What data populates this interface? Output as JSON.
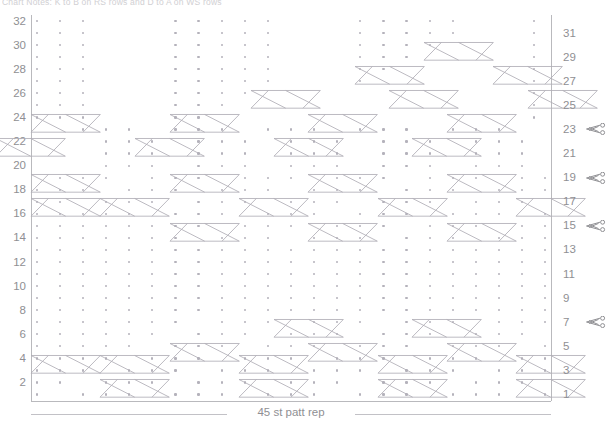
{
  "title": "Chart Notes: K to B on RS rows and D to A on WS rows",
  "chart_data": {
    "type": "table",
    "columns": 45,
    "rows": 32,
    "repeat_label": "45 st patt rep",
    "left_axis_label": "",
    "right_axis_label": "",
    "left_row_numbers": [
      32,
      30,
      28,
      26,
      24,
      22,
      20,
      18,
      16,
      14,
      12,
      10,
      8,
      6,
      4,
      2
    ],
    "right_row_numbers": [
      31,
      29,
      27,
      25,
      23,
      21,
      19,
      17,
      15,
      13,
      11,
      9,
      7,
      5,
      3,
      1
    ],
    "scissor_marker_rows": [
      23,
      19,
      15,
      7
    ],
    "legend": [
      {
        "symbol": "dot",
        "name": "purl-stitch"
      },
      {
        "symbol": "cable-cross",
        "name": "6-stitch-cable-cross"
      }
    ],
    "colors": {
      "grid_line": "#b9b9bd",
      "dot": "#b4b2bb",
      "cable_stroke": "#b0aeb6",
      "label_text": "#8f8f93",
      "background": "#ffffff"
    },
    "grid": {
      "cell_width": 11.555,
      "cell_height": 12.05,
      "origin_x": 31,
      "origin_y": 15
    },
    "dot_cells": [
      {
        "row": 32,
        "cols": [
          1,
          3,
          5,
          13,
          15,
          17,
          19,
          21,
          29,
          31,
          33,
          35,
          37,
          44
        ]
      },
      {
        "row": 31,
        "cols": [
          1,
          3,
          5,
          13,
          15,
          17,
          19,
          21,
          29,
          31,
          33,
          35,
          37,
          44
        ]
      },
      {
        "row": 30,
        "cols": [
          1,
          3,
          5,
          13,
          15,
          17,
          19,
          21,
          29,
          31,
          33,
          35,
          44
        ]
      },
      {
        "row": 29,
        "cols": [
          1,
          3,
          5,
          13,
          15,
          17,
          19,
          21,
          29,
          31,
          33,
          44
        ]
      },
      {
        "row": 28,
        "cols": [
          1,
          3,
          5,
          13,
          15,
          17,
          19,
          21,
          29,
          31,
          44
        ]
      },
      {
        "row": 27,
        "cols": [
          1,
          3,
          5,
          13,
          15,
          17,
          19,
          21,
          29,
          44
        ]
      },
      {
        "row": 26,
        "cols": [
          1,
          3,
          5,
          13,
          15,
          17,
          19,
          44
        ]
      },
      {
        "row": 25,
        "cols": [
          1,
          3,
          5,
          13,
          15,
          17,
          44
        ]
      },
      {
        "row": 24,
        "cols": [
          1,
          3,
          5,
          13,
          15,
          44
        ]
      },
      {
        "row": 23,
        "cols": [
          5,
          7,
          9,
          13,
          15,
          17,
          21,
          23,
          25,
          29,
          31,
          33,
          37,
          39,
          41
        ]
      },
      {
        "row": 22,
        "cols": [
          7,
          9,
          11,
          15,
          17,
          19,
          23,
          25,
          27,
          31,
          33,
          35,
          39,
          41,
          43
        ]
      },
      {
        "row": 21,
        "cols": [
          7,
          9,
          11,
          15,
          17,
          19,
          23,
          25,
          27,
          31,
          33,
          35,
          39,
          41,
          43
        ]
      },
      {
        "row": 20,
        "cols": [
          7,
          9,
          11,
          15,
          17,
          19,
          23,
          25,
          27,
          31,
          33,
          35,
          39,
          41,
          43
        ]
      },
      {
        "row": 19,
        "cols": [
          3,
          5,
          7,
          11,
          13,
          15,
          19,
          21,
          23,
          27,
          29,
          31,
          35,
          37,
          39,
          43,
          45
        ]
      },
      {
        "row": 18,
        "cols": [
          1,
          3,
          5,
          9,
          11,
          13,
          17,
          19,
          21,
          25,
          27,
          29,
          33,
          35,
          37,
          41,
          43,
          45
        ]
      },
      {
        "row": 17,
        "cols": [
          1,
          3,
          7,
          9,
          11,
          15,
          17,
          19,
          23,
          25,
          27,
          31,
          33,
          35,
          39,
          41,
          43
        ]
      },
      {
        "row": 16,
        "cols": [
          1,
          3,
          5,
          7,
          9,
          13,
          15,
          17,
          21,
          23,
          25,
          29,
          31,
          33,
          37,
          39,
          41,
          45
        ]
      },
      {
        "row": 15,
        "cols": [
          1,
          3,
          5,
          7,
          9,
          11,
          13,
          15,
          19,
          21,
          23,
          27,
          29,
          31,
          35,
          37,
          39,
          43,
          45
        ]
      },
      {
        "row": 14,
        "cols": [
          1,
          3,
          5,
          7,
          9,
          11,
          13,
          17,
          19,
          21,
          25,
          27,
          29,
          33,
          35,
          37,
          41,
          43,
          45
        ]
      },
      {
        "row": 13,
        "cols": [
          1,
          3,
          5,
          7,
          9,
          11,
          13,
          15,
          17,
          19,
          21,
          23,
          25,
          27,
          29,
          31,
          33,
          35,
          37,
          39,
          41,
          43,
          45
        ]
      },
      {
        "row": 12,
        "cols": [
          1,
          3,
          5,
          7,
          9,
          11,
          13,
          15,
          17,
          19,
          21,
          23,
          25,
          27,
          29,
          31,
          33,
          35,
          37,
          39,
          41,
          43,
          45
        ]
      },
      {
        "row": 11,
        "cols": [
          1,
          3,
          5,
          7,
          9,
          11,
          13,
          15,
          17,
          19,
          21,
          23,
          25,
          27,
          29,
          31,
          33,
          35,
          37,
          39,
          41,
          43,
          45
        ]
      },
      {
        "row": 10,
        "cols": [
          1,
          3,
          5,
          7,
          9,
          11,
          13,
          15,
          17,
          19,
          21,
          23,
          25,
          27,
          29,
          31,
          33,
          35,
          37,
          39,
          41,
          43,
          45
        ]
      },
      {
        "row": 9,
        "cols": [
          1,
          3,
          5,
          7,
          9,
          11,
          13,
          15,
          17,
          19,
          21,
          23,
          25,
          27,
          29,
          31,
          33,
          35,
          37,
          39,
          41,
          43,
          45
        ]
      },
      {
        "row": 8,
        "cols": [
          1,
          3,
          5,
          7,
          9,
          11,
          13,
          15,
          17,
          19,
          21,
          23,
          25,
          27,
          29,
          31,
          33,
          35,
          37,
          39,
          41,
          43,
          45
        ]
      },
      {
        "row": 7,
        "cols": [
          1,
          3,
          5,
          7,
          9,
          11,
          13,
          17,
          19,
          21,
          25,
          27,
          29,
          33,
          35,
          37,
          41,
          43,
          45
        ]
      },
      {
        "row": 6,
        "cols": [
          1,
          3,
          5,
          7,
          9,
          11,
          15,
          17,
          19,
          23,
          25,
          27,
          31,
          33,
          35,
          39,
          41,
          43
        ]
      },
      {
        "row": 5,
        "cols": [
          1,
          3,
          5,
          7,
          9,
          13,
          15,
          17,
          21,
          23,
          25,
          29,
          31,
          33,
          37,
          39,
          41,
          45
        ]
      },
      {
        "row": 4,
        "cols": [
          1,
          3,
          5,
          7,
          11,
          13,
          15,
          19,
          21,
          23,
          27,
          29,
          31,
          35,
          37,
          39,
          43,
          45
        ]
      },
      {
        "row": 3,
        "cols": [
          1,
          3,
          5,
          9,
          11,
          13,
          17,
          19,
          21,
          25,
          27,
          29,
          33,
          35,
          37,
          41,
          43,
          45
        ]
      },
      {
        "row": 2,
        "cols": [
          1,
          3,
          7,
          9,
          11,
          15,
          17,
          19,
          23,
          25,
          27,
          31,
          33,
          35,
          39,
          41,
          43
        ]
      },
      {
        "row": 1,
        "cols": [
          1,
          5,
          7,
          9,
          13,
          15,
          17,
          21,
          23,
          25,
          29,
          31,
          33,
          37,
          39,
          41,
          45
        ]
      }
    ],
    "cable_crossings": [
      {
        "row": 30,
        "col": 35,
        "width": 6,
        "type": "x-cross"
      },
      {
        "row": 28,
        "col": 29,
        "width": 6,
        "type": "x-cross"
      },
      {
        "row": 28,
        "col": 41,
        "width": 6,
        "type": "x-cross"
      },
      {
        "row": 26,
        "col": 20,
        "width": 6,
        "type": "x-cross"
      },
      {
        "row": 26,
        "col": 32,
        "width": 6,
        "type": "x-cross"
      },
      {
        "row": 26,
        "col": 44,
        "width": 6,
        "type": "x-cross"
      },
      {
        "row": 24,
        "col": 1,
        "width": 6,
        "type": "x-cross"
      },
      {
        "row": 24,
        "col": 13,
        "width": 6,
        "type": "x-cross"
      },
      {
        "row": 24,
        "col": 25,
        "width": 6,
        "type": "x-cross"
      },
      {
        "row": 24,
        "col": 37,
        "width": 6,
        "type": "x-cross"
      },
      {
        "row": 22,
        "col": -2,
        "width": 6,
        "type": "x-cross"
      },
      {
        "row": 22,
        "col": 10,
        "width": 6,
        "type": "x-cross"
      },
      {
        "row": 22,
        "col": 22,
        "width": 6,
        "type": "x-cross"
      },
      {
        "row": 22,
        "col": 34,
        "width": 6,
        "type": "x-cross"
      },
      {
        "row": 19,
        "col": 1,
        "width": 6,
        "type": "x-cross"
      },
      {
        "row": 19,
        "col": 13,
        "width": 6,
        "type": "x-cross"
      },
      {
        "row": 19,
        "col": 25,
        "width": 6,
        "type": "x-cross"
      },
      {
        "row": 19,
        "col": 37,
        "width": 6,
        "type": "x-cross"
      },
      {
        "row": 17,
        "col": 1,
        "width": 6,
        "type": "x-cross"
      },
      {
        "row": 17,
        "col": 7,
        "width": 6,
        "type": "x-cross"
      },
      {
        "row": 17,
        "col": 19,
        "width": 6,
        "type": "x-cross"
      },
      {
        "row": 17,
        "col": 31,
        "width": 6,
        "type": "x-cross"
      },
      {
        "row": 17,
        "col": 43,
        "width": 6,
        "type": "x-cross"
      },
      {
        "row": 15,
        "col": 13,
        "width": 6,
        "type": "x-cross"
      },
      {
        "row": 15,
        "col": 25,
        "width": 6,
        "type": "x-cross"
      },
      {
        "row": 15,
        "col": 37,
        "width": 6,
        "type": "x-cross"
      },
      {
        "row": 7,
        "col": 22,
        "width": 6,
        "type": "x-cross"
      },
      {
        "row": 7,
        "col": 34,
        "width": 6,
        "type": "x-cross"
      },
      {
        "row": 5,
        "col": 13,
        "width": 6,
        "type": "x-cross"
      },
      {
        "row": 5,
        "col": 25,
        "width": 6,
        "type": "x-cross"
      },
      {
        "row": 5,
        "col": 37,
        "width": 6,
        "type": "x-cross"
      },
      {
        "row": 4,
        "col": 1,
        "width": 6,
        "type": "x-cross"
      },
      {
        "row": 4,
        "col": 7,
        "width": 6,
        "type": "x-cross"
      },
      {
        "row": 4,
        "col": 19,
        "width": 6,
        "type": "x-cross"
      },
      {
        "row": 4,
        "col": 31,
        "width": 6,
        "type": "x-cross"
      },
      {
        "row": 4,
        "col": 43,
        "width": 6,
        "type": "x-cross"
      },
      {
        "row": 2,
        "col": 7,
        "width": 6,
        "type": "x-cross"
      },
      {
        "row": 2,
        "col": 19,
        "width": 6,
        "type": "x-cross"
      },
      {
        "row": 2,
        "col": 31,
        "width": 6,
        "type": "x-cross"
      },
      {
        "row": 2,
        "col": 43,
        "width": 6,
        "type": "x-cross"
      }
    ]
  }
}
